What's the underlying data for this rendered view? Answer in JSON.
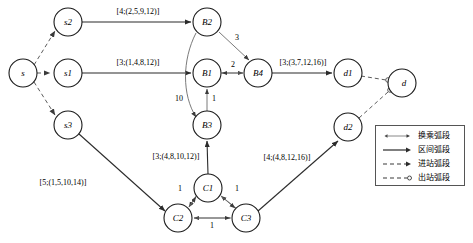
{
  "diagram": {
    "type": "network-graph",
    "nodes": [
      {
        "id": "s",
        "label": "s",
        "x": 23,
        "y": 73,
        "r": 14
      },
      {
        "id": "s2",
        "label": "s2",
        "x": 68,
        "y": 22,
        "r": 14
      },
      {
        "id": "s1",
        "label": "s1",
        "x": 68,
        "y": 73,
        "r": 14
      },
      {
        "id": "s3",
        "label": "s3",
        "x": 68,
        "y": 125,
        "r": 14
      },
      {
        "id": "B2",
        "label": "B2",
        "x": 207,
        "y": 22,
        "r": 14
      },
      {
        "id": "B1",
        "label": "B1",
        "x": 207,
        "y": 73,
        "r": 14
      },
      {
        "id": "B3",
        "label": "B3",
        "x": 207,
        "y": 125,
        "r": 14
      },
      {
        "id": "B4",
        "label": "B4",
        "x": 258,
        "y": 73,
        "r": 14
      },
      {
        "id": "d1",
        "label": "d1",
        "x": 348,
        "y": 73,
        "r": 14
      },
      {
        "id": "d",
        "label": "d",
        "x": 402,
        "y": 83,
        "r": 14
      },
      {
        "id": "d2",
        "label": "d2",
        "x": 348,
        "y": 127,
        "r": 14
      },
      {
        "id": "C1",
        "label": "C1",
        "x": 208,
        "y": 188,
        "r": 14
      },
      {
        "id": "C2",
        "label": "C2",
        "x": 178,
        "y": 218,
        "r": 14
      },
      {
        "id": "C3",
        "label": "C3",
        "x": 246,
        "y": 218,
        "r": 14
      }
    ],
    "edges": [
      {
        "from": "s",
        "to": "s2",
        "kind": "entry",
        "label": ""
      },
      {
        "from": "s",
        "to": "s1",
        "kind": "entry",
        "label": ""
      },
      {
        "from": "s",
        "to": "s3",
        "kind": "entry",
        "label": ""
      },
      {
        "from": "s2",
        "to": "B2",
        "kind": "section",
        "label": "[4;(2,5,9,12)]"
      },
      {
        "from": "s1",
        "to": "B1",
        "kind": "section",
        "label": "[3;(1,4,8,12)]"
      },
      {
        "from": "s3",
        "to": "C2",
        "kind": "section",
        "label": "[5;(1,5,10,14)]"
      },
      {
        "from": "B2",
        "to": "B4",
        "kind": "transfer",
        "label": "3"
      },
      {
        "from": "B1",
        "to": "B4",
        "kind": "transfer",
        "label": "2"
      },
      {
        "from": "B3",
        "to": "B1",
        "kind": "transfer",
        "label": "1"
      },
      {
        "from": "B2",
        "to": "B3",
        "kind": "transfer",
        "label": "10"
      },
      {
        "from": "B4",
        "to": "d1",
        "kind": "section",
        "label": "[3;(3,7,12,16)]"
      },
      {
        "from": "C1",
        "to": "B3",
        "kind": "section",
        "label": "[3;(4,8,10,12)]"
      },
      {
        "from": "C3",
        "to": "d2",
        "kind": "section",
        "label": "[4;(4,8,12,16)]"
      },
      {
        "from": "C1",
        "to": "C2",
        "kind": "transfer",
        "label": "1"
      },
      {
        "from": "C3",
        "to": "C1",
        "kind": "transfer",
        "label": "1"
      },
      {
        "from": "C3",
        "to": "C2",
        "kind": "transfer",
        "label": "1"
      },
      {
        "from": "d1",
        "to": "d",
        "kind": "exit",
        "label": ""
      },
      {
        "from": "d2",
        "to": "d",
        "kind": "exit",
        "label": ""
      }
    ],
    "edge_labels": [
      {
        "id": "lbl-s2-B2",
        "text": "[4;(2,5,9,12)]",
        "x": 138,
        "y": 11
      },
      {
        "id": "lbl-s1-B1",
        "text": "[3;(1,4,8,12)]",
        "x": 138,
        "y": 62
      },
      {
        "id": "lbl-B4-d1",
        "text": "[3;(3,7,12,16)]",
        "x": 303,
        "y": 62
      },
      {
        "id": "lbl-C1-B3",
        "text": "[3;(4,8,10,12)]",
        "x": 176,
        "y": 156
      },
      {
        "id": "lbl-C3-d2",
        "text": "[4;(4,8,12,16)]",
        "x": 287,
        "y": 157
      },
      {
        "id": "lbl-s3-C2",
        "text": "[5;(1,5,10,14)]",
        "x": 63,
        "y": 182
      },
      {
        "id": "w-B2-B4",
        "text": "3",
        "x": 237,
        "y": 37
      },
      {
        "id": "w-B1-B4",
        "text": "2",
        "x": 233,
        "y": 64
      },
      {
        "id": "w-B3-B1",
        "text": "1",
        "x": 214,
        "y": 98
      },
      {
        "id": "w-B2-B3",
        "text": "10",
        "x": 179,
        "y": 98
      },
      {
        "id": "w-C1-C2",
        "text": "1",
        "x": 180,
        "y": 188
      },
      {
        "id": "w-C3-C1",
        "text": "1",
        "x": 237,
        "y": 188
      },
      {
        "id": "w-C3-C2",
        "text": "1",
        "x": 212,
        "y": 225
      }
    ]
  },
  "legend": {
    "items": [
      {
        "id": "transfer",
        "style": "double-arrow-solid-thin",
        "label": "换乘弧段"
      },
      {
        "id": "section",
        "style": "arrow-solid",
        "label": "区间弧段"
      },
      {
        "id": "entry",
        "style": "arrow-dashed",
        "label": "进站弧段"
      },
      {
        "id": "exit",
        "style": "circle-dashed",
        "label": "出站弧段"
      }
    ]
  },
  "colors": {
    "section_arc": "#2b2b2b",
    "transfer_arc": "#6b6b6b",
    "dashed_arc": "#4a4a4a",
    "node_stroke": "#1a1a1a",
    "background": "#ffffff"
  }
}
